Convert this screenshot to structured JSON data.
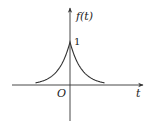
{
  "chart_data": {
    "type": "line",
    "title": "",
    "xlabel": "t",
    "ylabel": "f(t)",
    "origin_label": "O",
    "annotations": [
      {
        "text": "1",
        "at": [
          0,
          1
        ]
      }
    ],
    "function": "f(t) = e^{-|t|}",
    "x": [
      -3,
      -2.5,
      -2,
      -1.5,
      -1,
      -0.5,
      0,
      0.5,
      1,
      1.5,
      2,
      2.5,
      3
    ],
    "series": [
      {
        "name": "f(t)",
        "values": [
          0.05,
          0.08,
          0.14,
          0.22,
          0.37,
          0.61,
          1,
          0.61,
          0.37,
          0.22,
          0.14,
          0.08,
          0.05
        ]
      }
    ],
    "grid": false,
    "legend": "none"
  },
  "labels": {
    "y_axis": "f(t)",
    "x_axis": "t",
    "origin": "O",
    "peak": "1"
  },
  "colors": {
    "axis": "#333333",
    "curve": "#333333",
    "background": "#ffffff"
  }
}
